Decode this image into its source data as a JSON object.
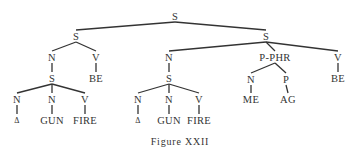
{
  "diagram": {
    "caption": "Figure XXII",
    "line_color": "#333333",
    "nodes": [
      {
        "id": "root",
        "label": "S",
        "x": 175,
        "y": 16
      },
      {
        "id": "ls",
        "label": "S",
        "x": 76,
        "y": 36
      },
      {
        "id": "ln",
        "label": "N",
        "x": 52,
        "y": 57
      },
      {
        "id": "lv",
        "label": "V",
        "x": 96,
        "y": 57
      },
      {
        "id": "lbe",
        "label": "BE",
        "x": 96,
        "y": 78
      },
      {
        "id": "lns",
        "label": "S",
        "x": 52,
        "y": 78
      },
      {
        "id": "ln1",
        "label": "N",
        "x": 17,
        "y": 99
      },
      {
        "id": "ln2",
        "label": "N",
        "x": 52,
        "y": 99
      },
      {
        "id": "lv2",
        "label": "V",
        "x": 85,
        "y": 99
      },
      {
        "id": "ld",
        "label": "Δ",
        "x": 17,
        "y": 120
      },
      {
        "id": "lgun",
        "label": "GUN",
        "x": 52,
        "y": 120
      },
      {
        "id": "lfire",
        "label": "FIRE",
        "x": 85,
        "y": 120
      },
      {
        "id": "rs",
        "label": "S",
        "x": 266,
        "y": 36
      },
      {
        "id": "rn",
        "label": "N",
        "x": 169,
        "y": 57
      },
      {
        "id": "rpp",
        "label": "P-PHR",
        "x": 275,
        "y": 57
      },
      {
        "id": "rv",
        "label": "V",
        "x": 338,
        "y": 57
      },
      {
        "id": "rbe",
        "label": "BE",
        "x": 338,
        "y": 78
      },
      {
        "id": "rns",
        "label": "S",
        "x": 169,
        "y": 78
      },
      {
        "id": "rn1",
        "label": "N",
        "x": 138,
        "y": 99
      },
      {
        "id": "rn2",
        "label": "N",
        "x": 169,
        "y": 99
      },
      {
        "id": "rv2",
        "label": "V",
        "x": 199,
        "y": 99
      },
      {
        "id": "rd",
        "label": "Δ",
        "x": 138,
        "y": 120
      },
      {
        "id": "rgun",
        "label": "GUN",
        "x": 169,
        "y": 120
      },
      {
        "id": "rfire",
        "label": "FIRE",
        "x": 199,
        "y": 120
      },
      {
        "id": "ppn",
        "label": "N",
        "x": 251,
        "y": 79
      },
      {
        "id": "ppp",
        "label": "P",
        "x": 286,
        "y": 79
      },
      {
        "id": "me",
        "label": "ME",
        "x": 251,
        "y": 99
      },
      {
        "id": "ag",
        "label": "AG",
        "x": 288,
        "y": 99
      }
    ],
    "edges": [
      [
        "root",
        "ls"
      ],
      [
        "root",
        "rs"
      ],
      [
        "ls",
        "ln"
      ],
      [
        "ls",
        "lv"
      ],
      [
        "lv",
        "lbe"
      ],
      [
        "ln",
        "lns"
      ],
      [
        "lns",
        "ln1"
      ],
      [
        "lns",
        "ln2"
      ],
      [
        "lns",
        "lv2"
      ],
      [
        "ln1",
        "ld"
      ],
      [
        "ln2",
        "lgun"
      ],
      [
        "lv2",
        "lfire"
      ],
      [
        "rs",
        "rn"
      ],
      [
        "rs",
        "rpp"
      ],
      [
        "rs",
        "rv"
      ],
      [
        "rv",
        "rbe"
      ],
      [
        "rn",
        "rns"
      ],
      [
        "rns",
        "rn1"
      ],
      [
        "rns",
        "rn2"
      ],
      [
        "rns",
        "rv2"
      ],
      [
        "rn1",
        "rd"
      ],
      [
        "rn2",
        "rgun"
      ],
      [
        "rv2",
        "rfire"
      ],
      [
        "rpp",
        "ppn"
      ],
      [
        "rpp",
        "ppp"
      ],
      [
        "ppn",
        "me"
      ],
      [
        "ppp",
        "ag"
      ]
    ]
  }
}
